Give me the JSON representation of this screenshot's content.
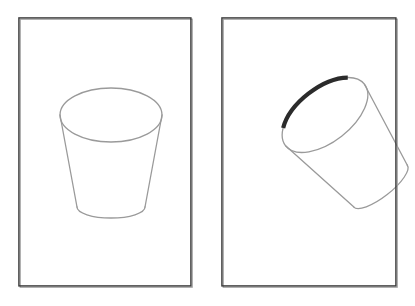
{
  "scene": {
    "title": "Cup orientation comparison",
    "background_color": "#ffffff",
    "width": 415,
    "height": 306,
    "panel_count": 2
  },
  "style": {
    "outline_color": "#9a9a9a",
    "highlight_color": "#2b2b2b",
    "frame_color": "#3a3a3a",
    "frame_shadow_color": "#9e9e9e",
    "panel_fill": "#ffffff",
    "outline_width": 1.3,
    "highlight_width": 4.2
  },
  "panels": [
    {
      "id": "panel-left",
      "label": "Upright cup",
      "x": 18,
      "y": 17,
      "width": 175,
      "height": 271,
      "object": {
        "name": "cup",
        "type": "tapered-cup-line-drawing",
        "orientation": "upright",
        "rotation_degrees": 0,
        "rim_center": [
          93,
          98
        ],
        "rim_radius_x": 51,
        "rim_radius_y": 27,
        "base_center": [
          93,
          196
        ],
        "base_radius_x": 34,
        "base_radius_y": 11,
        "has_rim_highlight": false,
        "highlight_arc": null
      }
    },
    {
      "id": "panel-right",
      "label": "Tilted cup with highlighted rim segment",
      "x": 221,
      "y": 17,
      "width": 177,
      "height": 271,
      "object": {
        "name": "cup",
        "type": "tapered-cup-line-drawing",
        "orientation": "tilted",
        "rotation_degrees": -38,
        "rim_center": [
          104,
          98
        ],
        "rim_radius_x": 50,
        "rim_radius_y": 27,
        "base_center": [
          41,
          147
        ],
        "base_radius_x": 34,
        "base_radius_y": 11,
        "has_rim_highlight": true,
        "highlight_arc": {
          "name": "rim-highlight-arc",
          "color": "#2b2b2b",
          "width": 4.2,
          "start_point": [
            79,
            89
          ],
          "end_point": [
            127,
            115
          ],
          "portion": "upper-right rim segment",
          "sweep_degrees": 110
        }
      }
    }
  ]
}
